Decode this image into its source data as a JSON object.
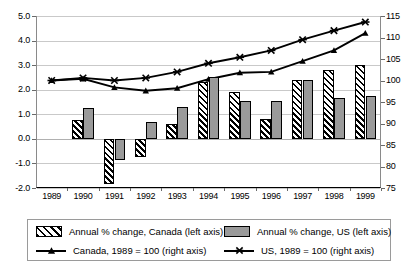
{
  "title_faint": "",
  "chart_data": {
    "type": "bar",
    "title": "",
    "subtitle": "",
    "xlabel": "",
    "ylabel_left": "Annual % change",
    "ylabel_right": "Index, 1989 = 100",
    "grid": true,
    "legend_position": "bottom",
    "categories": [
      "1989",
      "1990",
      "1991",
      "1992",
      "1993",
      "1994",
      "1995",
      "1996",
      "1997",
      "1998",
      "1999"
    ],
    "left_axis": {
      "ylim": [
        -2.0,
        5.0
      ],
      "ticks": [
        "5.0",
        "4.0",
        "3.0",
        "2.0",
        "1.0",
        "0.0",
        "-1.0",
        "-2.0"
      ],
      "tick_values": [
        5.0,
        4.0,
        3.0,
        2.0,
        1.0,
        0.0,
        -1.0,
        -2.0
      ]
    },
    "right_axis": {
      "ylim": [
        75,
        115
      ],
      "ticks": [
        "115",
        "110",
        "105",
        "100",
        "95",
        "90",
        "85",
        "80",
        "75"
      ],
      "tick_values": [
        115,
        110,
        105,
        100,
        95,
        90,
        85,
        80,
        75
      ]
    },
    "series": [
      {
        "name": "Annual % change, Canada (left axis)",
        "key": "ca_bar",
        "type": "bar",
        "axis": "left",
        "style": "hatched",
        "values": [
          null,
          0.75,
          -1.85,
          -0.75,
          0.6,
          2.3,
          1.9,
          0.8,
          2.4,
          2.8,
          3.0
        ]
      },
      {
        "name": "Annual % change, US (left axis)",
        "key": "us_bar",
        "type": "bar",
        "axis": "left",
        "style": "solid-gray",
        "values": [
          null,
          1.25,
          -0.85,
          0.7,
          1.3,
          2.5,
          1.55,
          1.55,
          2.4,
          1.65,
          1.75
        ]
      },
      {
        "name": "Canada, 1989 = 100 (right axis)",
        "key": "ca_line",
        "type": "line",
        "axis": "right",
        "marker": "triangle",
        "values": [
          100.0,
          100.4,
          98.4,
          97.6,
          98.2,
          100.3,
          101.8,
          102.0,
          104.5,
          107.0,
          111.0
        ]
      },
      {
        "name": "US, 1989 = 100 (right axis)",
        "key": "us_line",
        "type": "line",
        "axis": "right",
        "marker": "star",
        "values": [
          100.0,
          100.6,
          100.0,
          100.6,
          102.0,
          104.0,
          105.4,
          107.0,
          109.5,
          111.6,
          113.6
        ]
      }
    ]
  },
  "legend": {
    "entries": [
      {
        "label": "Annual % change, Canada (left axis)",
        "swatch": "hatched-bar-swatch"
      },
      {
        "label": "Annual % change, US (left axis)",
        "swatch": "gray-bar-swatch"
      },
      {
        "label": "Canada, 1989 = 100 (right axis)",
        "swatch": "triangle-line-swatch"
      },
      {
        "label": "US, 1989 = 100 (right axis)",
        "swatch": "star-line-swatch"
      }
    ]
  }
}
